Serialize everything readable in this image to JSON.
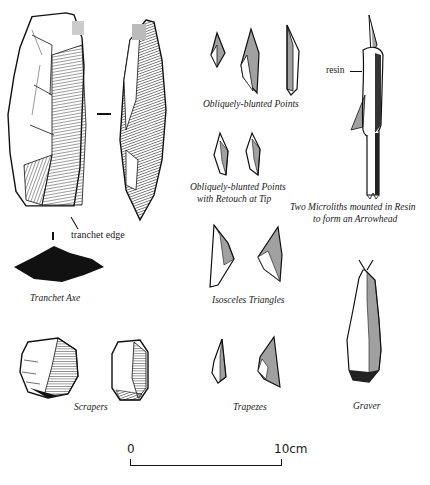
{
  "figure": {
    "groups": [
      {
        "id": "tranchet-axe",
        "caption": "Tranchet Axe",
        "annotations": [
          "tranchet edge"
        ]
      },
      {
        "id": "scrapers",
        "caption": "Scrapers"
      },
      {
        "id": "obliquely-blunted-points",
        "caption": "Obliquely-blunted Points"
      },
      {
        "id": "obliquely-blunted-points-retouch",
        "caption_line1": "Obliquely-blunted Points",
        "caption_line2": "with Retouch at Tip"
      },
      {
        "id": "isosceles-triangles",
        "caption": "Isosceles Triangles"
      },
      {
        "id": "trapezes",
        "caption": "Trapezes"
      },
      {
        "id": "arrowhead",
        "caption_line1": "Two Microliths mounted in Resin",
        "caption_line2": "to form an Arrowhead",
        "annotations": [
          "resin"
        ]
      },
      {
        "id": "graver",
        "caption": "Graver"
      }
    ],
    "scale_bar": {
      "start_label": "0",
      "end_label": "10cm"
    }
  }
}
